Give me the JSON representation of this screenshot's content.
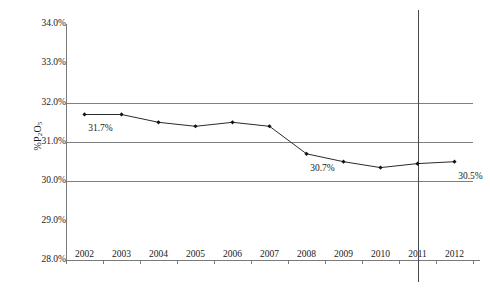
{
  "chart_data": {
    "type": "line",
    "title": "",
    "subtitle": "",
    "xlabel": "",
    "ylabel": "%P2O5",
    "ylabel_rich": "%P₂O₅",
    "categories": [
      "2002",
      "2003",
      "2004",
      "2005",
      "2006",
      "2007",
      "2008",
      "2009",
      "2010",
      "2011",
      "2012"
    ],
    "values": [
      31.7,
      31.7,
      31.5,
      31.4,
      31.5,
      31.4,
      30.7,
      30.5,
      30.35,
      30.45,
      30.5
    ],
    "series": [
      {
        "name": "%P2O5",
        "values": [
          31.7,
          31.7,
          31.5,
          31.4,
          31.5,
          31.4,
          30.7,
          30.5,
          30.35,
          30.45,
          30.5
        ]
      }
    ],
    "ylim": [
      28.0,
      34.0
    ],
    "ytick_values": [
      34.0,
      33.0,
      32.0,
      31.0,
      30.0,
      29.0,
      28.0
    ],
    "ytick_labels": [
      "34.0%",
      "33.0%",
      "32.0%",
      "31.0%",
      "30.0%",
      "29.0%",
      "28.0%"
    ],
    "gridlines": {
      "horizontal_at": [
        32.0,
        31.0,
        30.0
      ],
      "grid": true,
      "color": "#808080"
    },
    "point_labels": [
      {
        "category": "2002",
        "value": 31.7,
        "text": "31.7%"
      },
      {
        "category": "2008",
        "value": 30.7,
        "text": "30.7%"
      },
      {
        "category": "2012",
        "value": 30.5,
        "text": "30.5%"
      }
    ],
    "annotations": [
      {
        "type": "vertical-line",
        "at_category": "2011",
        "color": "#4a4a4a"
      }
    ],
    "legend": {
      "visible": false,
      "position": "none"
    },
    "marker": {
      "shape": "diamond",
      "color": "#111111"
    },
    "line_color": "#2b2b2b"
  },
  "axes": {
    "y_label_text": "%P",
    "y_label_sub1": "2",
    "y_label_mid": "O",
    "y_label_sub2": "5"
  },
  "watermark": {
    "line1": "",
    "line2": ""
  }
}
